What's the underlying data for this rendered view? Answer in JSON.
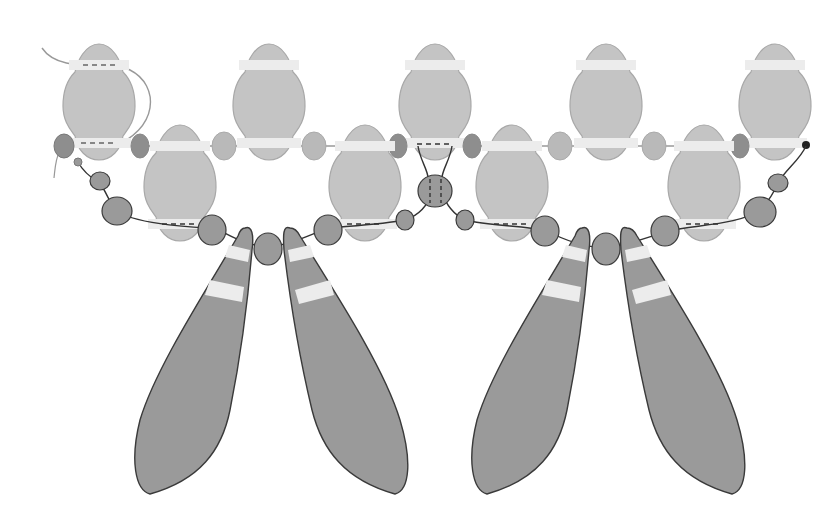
{
  "diagram": {
    "title": "",
    "colors": {
      "background": "#ffffff",
      "light_bead": "#c4c4c4",
      "light_bead_stroke": "#a8a8a8",
      "dark_bead": "#9a9a9a",
      "dark_bead_stroke": "#3a3a3a",
      "rondelle": "#b9b9b9",
      "rondelle_dark": "#8e8e8e",
      "hole_band": "#ececec",
      "thread": "#3a3a3a",
      "thread_light": "#999999"
    },
    "top_row_beads_x": [
      99,
      269,
      435,
      606,
      775
    ],
    "second_row_beads_x": [
      180,
      365,
      512,
      704
    ],
    "drops_x": [
      190,
      352,
      520,
      690
    ],
    "labels": []
  }
}
